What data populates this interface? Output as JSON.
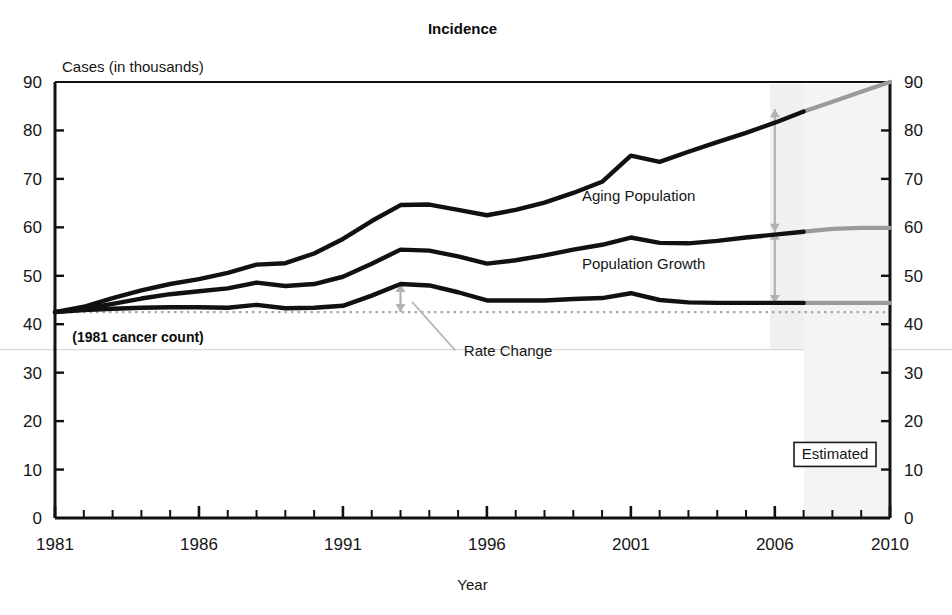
{
  "chart_data": {
    "type": "line",
    "title": "Incidence",
    "xlabel": "Year",
    "ylabel": "Cases (in thousands)",
    "xlim": [
      1981,
      2010
    ],
    "ylim": [
      0,
      90
    ],
    "ytick_step": 10,
    "grid": false,
    "legend_position": "inline-annotations",
    "x": [
      1981,
      1982,
      1983,
      1984,
      1985,
      1986,
      1987,
      1988,
      1989,
      1990,
      1991,
      1992,
      1993,
      1994,
      1995,
      1996,
      1997,
      1998,
      1999,
      2000,
      2001,
      2002,
      2003,
      2004,
      2005,
      2006,
      2007,
      2008,
      2009,
      2010
    ],
    "y_ticks": [
      0,
      10,
      20,
      30,
      40,
      50,
      60,
      70,
      80,
      90
    ],
    "x_tick_labels": [
      "1981",
      "1986",
      "1991",
      "1996",
      "2001",
      "2006",
      "2010"
    ],
    "x_tick_label_values": [
      1981,
      1986,
      1991,
      1996,
      2001,
      2006,
      2010
    ],
    "series": [
      {
        "name": "Aging Population",
        "label": "Aging Population",
        "color": "#111111",
        "estimated_color": "#9a9a9a",
        "values": [
          42.5,
          43.6,
          45.4,
          47.0,
          48.3,
          49.3,
          50.6,
          52.3,
          52.6,
          54.6,
          57.6,
          61.3,
          64.6,
          64.7,
          63.6,
          62.5,
          63.6,
          65.1,
          67.1,
          69.4,
          74.8,
          73.5,
          75.6,
          77.6,
          79.5,
          81.6,
          83.9,
          85.9,
          88.0,
          90.0
        ]
      },
      {
        "name": "Population Growth",
        "label": "Population Growth",
        "color": "#111111",
        "estimated_color": "#9a9a9a",
        "values": [
          42.5,
          43.2,
          44.2,
          45.3,
          46.2,
          46.8,
          47.4,
          48.6,
          47.9,
          48.3,
          49.8,
          52.5,
          55.4,
          55.2,
          54.0,
          52.5,
          53.2,
          54.2,
          55.4,
          56.4,
          57.9,
          56.8,
          56.7,
          57.2,
          57.9,
          58.5,
          59.1,
          59.7,
          59.9,
          59.9
        ]
      },
      {
        "name": "Rate Change",
        "label": "Rate Change",
        "color": "#111111",
        "estimated_color": "#9a9a9a",
        "values": [
          42.5,
          42.9,
          43.2,
          43.4,
          43.5,
          43.5,
          43.4,
          44.0,
          43.3,
          43.4,
          43.8,
          45.9,
          48.3,
          48.0,
          46.6,
          44.9,
          44.9,
          44.9,
          45.2,
          45.4,
          46.4,
          45.0,
          44.5,
          44.4,
          44.4,
          44.4,
          44.4,
          44.4,
          44.4,
          44.4
        ]
      }
    ],
    "baseline": {
      "label": "(1981 cancer count)",
      "value": 42.5,
      "style": "dotted"
    },
    "estimated_region": {
      "label": "Estimated",
      "start_year": 2007,
      "end_year": 2010
    },
    "annotations": [
      {
        "name": "aging-population",
        "text": "Aging Population",
        "x_year": 1999.3,
        "y_value": 65.5
      },
      {
        "name": "population-growth",
        "text": "Population Growth",
        "x_year": 1999.3,
        "y_value": 51.5
      },
      {
        "name": "rate-change",
        "text": "Rate Change",
        "x_year": 1995.2,
        "y_value": 33.5
      },
      {
        "name": "baseline-note",
        "text": "(1981 cancer count)",
        "x_year": 1981.6,
        "y_value": 36.3
      }
    ],
    "measure_arrows": [
      {
        "name": "aging-population-gap",
        "x_year": 2006.0,
        "from_value": 84.4,
        "to_value": 59.1,
        "color": "#b2b2b2"
      },
      {
        "name": "population-growth-gap",
        "x_year": 2006.0,
        "from_value": 59.1,
        "to_value": 44.4,
        "color": "#b2b2b2"
      },
      {
        "name": "rate-change-gap",
        "x_year": 1993.0,
        "from_value": 48.3,
        "to_value": 42.5,
        "color": "#b2b2b2"
      }
    ],
    "leader_line": {
      "name": "rate-change-leader",
      "from_x_year": 1993.4,
      "from_y_value": 44.6,
      "to_x_year": 1994.9,
      "to_y_value": 34.6,
      "color": "#b8b8b8"
    },
    "colors": {
      "line": "#111111",
      "estimated_line": "#9a9a9a",
      "axis": "#111111",
      "baseline": "#a8a8a8",
      "arrow": "#b2b2b2",
      "background": "#ffffff"
    }
  }
}
